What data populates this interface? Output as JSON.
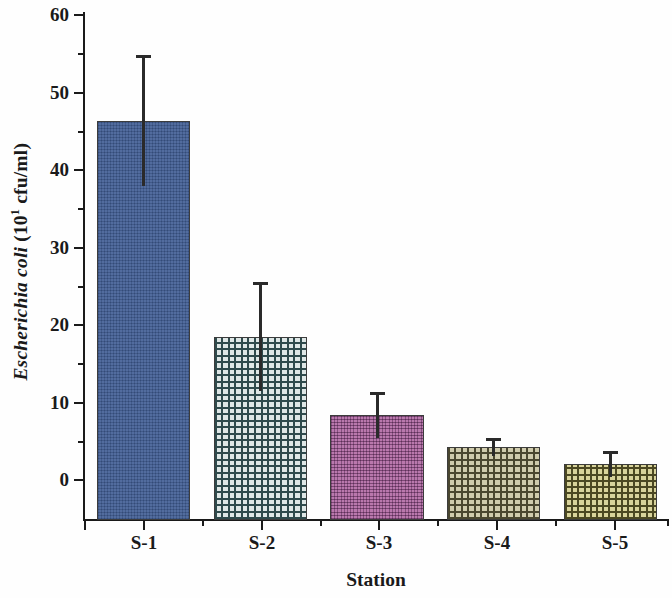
{
  "chart_data": {
    "type": "bar",
    "title": "",
    "xlabel": "Station",
    "ylabel_species": "Escherichia coli",
    "ylabel_unit_prefix": " (10",
    "ylabel_unit_exp": "1",
    "ylabel_unit_suffix": " cfu/ml)",
    "ylabel_full": "Escherichia coli (10^1 cfu/ml)",
    "categories": [
      "S-1",
      "S-2",
      "S-3",
      "S-4",
      "S-5"
    ],
    "values": [
      45.9,
      17.8,
      7.6,
      3.5,
      1.3
    ],
    "errors_upper": [
      8.5,
      7.1,
      3.0,
      1.2,
      1.7
    ],
    "errors_lower": [
      8.5,
      7.1,
      3.0,
      1.2,
      1.7
    ],
    "error_top_values": [
      54.4,
      24.9,
      10.6,
      4.7,
      3.0
    ],
    "error_bottom_values": [
      37.4,
      10.7,
      4.6,
      2.3,
      -0.4
    ],
    "ylim": [
      -6,
      60
    ],
    "yticks": [
      0,
      10,
      20,
      30,
      40,
      50,
      60
    ],
    "ytick_labels": [
      "0",
      "10",
      "20",
      "30",
      "40",
      "50",
      "60"
    ],
    "y_minor_ticks": [
      5,
      15,
      25,
      35,
      45,
      55
    ],
    "grid": false,
    "legend": "none",
    "bar_colors": [
      "#3f5c94",
      "#dfe7e6",
      "#a9589a",
      "#cfcbad",
      "#d8d39b"
    ],
    "bar_patterns": [
      "solid",
      "cross-hatch",
      "fine-grid",
      "cross-hatch",
      "cross-hatch"
    ],
    "error_bar_color": "#2a2a2a",
    "axis_color": "#1a1a1a"
  },
  "axes": {
    "x_tick_labels": [
      "S-1",
      "S-2",
      "S-3",
      "S-4",
      "S-5"
    ],
    "y_tick_labels": [
      "60",
      "50",
      "40",
      "30",
      "20",
      "10",
      "0"
    ]
  }
}
